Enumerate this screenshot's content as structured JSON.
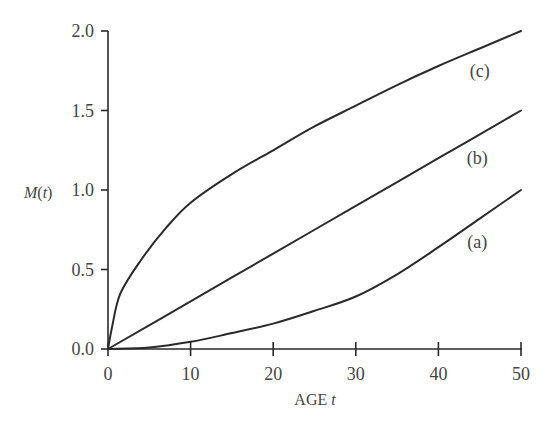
{
  "chart_data": {
    "type": "line",
    "title": "",
    "xlabel": "AGE t",
    "ylabel": "M(t)",
    "xlim": [
      0,
      50
    ],
    "ylim": [
      0,
      2.0
    ],
    "grid": false,
    "legend": "none (curves labeled inline)",
    "x_ticks": [
      "0",
      "10",
      "20",
      "30",
      "40",
      "50"
    ],
    "y_ticks": [
      "0.0",
      "0.5",
      "1.0",
      "1.5",
      "2.0"
    ],
    "series": [
      {
        "name": "(a)",
        "x": [
          0,
          5,
          10,
          15,
          20,
          25,
          30,
          35,
          40,
          45,
          50
        ],
        "values": [
          0,
          0.01,
          0.045,
          0.1,
          0.16,
          0.24,
          0.33,
          0.47,
          0.64,
          0.82,
          1.0
        ]
      },
      {
        "name": "(b)",
        "x": [
          0,
          10,
          20,
          30,
          40,
          50
        ],
        "values": [
          0,
          0.3,
          0.6,
          0.9,
          1.2,
          1.5
        ]
      },
      {
        "name": "(c)",
        "x": [
          0,
          0.5,
          1.5,
          4,
          7,
          10,
          15,
          20,
          25,
          30,
          35,
          40,
          45,
          50
        ],
        "values": [
          0,
          0.14,
          0.35,
          0.56,
          0.76,
          0.92,
          1.1,
          1.25,
          1.4,
          1.53,
          1.66,
          1.78,
          1.89,
          2.0
        ]
      }
    ],
    "annotations": [
      {
        "text": "(c)",
        "x": 45,
        "y": 1.75
      },
      {
        "text": "(b)",
        "x": 44.7,
        "y": 1.2
      },
      {
        "text": "(a)",
        "x": 44.7,
        "y": 0.67
      }
    ]
  },
  "labels": {
    "y_axis_main": "M",
    "y_axis_paren_open": "(",
    "y_axis_var": "t",
    "y_axis_paren_close": ")",
    "x_axis_main": "AGE ",
    "x_axis_var": "t"
  }
}
